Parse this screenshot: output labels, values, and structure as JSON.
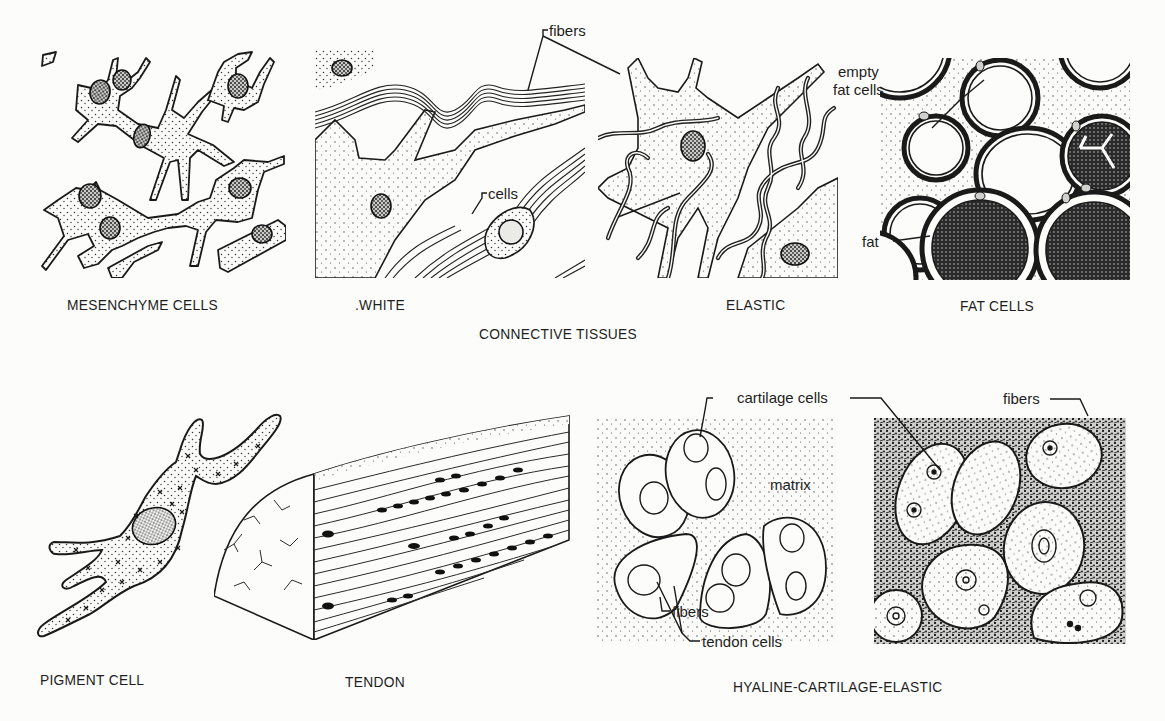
{
  "page": {
    "section_title": "CONNECTIVE TISSUES",
    "ink_color": "#1a1a1a",
    "paper_color": "#fcfcfb"
  },
  "top_row": {
    "panels": [
      {
        "id": "mesenchyme",
        "caption": "MESENCHYME CELLS"
      },
      {
        "id": "white",
        "caption": ".WHITE"
      },
      {
        "id": "elastic",
        "caption": "ELASTIC"
      },
      {
        "id": "fat",
        "caption": "FAT CELLS"
      }
    ],
    "callouts": {
      "fibers": "fibers",
      "cells": "cells",
      "empty_fat_cells_line1": "empty",
      "empty_fat_cells_line2": "fat cells",
      "fat": "fat"
    }
  },
  "bottom_row": {
    "panels": [
      {
        "id": "pigment",
        "caption": "PIGMENT CELL"
      },
      {
        "id": "tendon",
        "caption": "TENDON"
      },
      {
        "id": "cartilage",
        "caption": "HYALINE-CARTILAGE-ELASTIC"
      }
    ],
    "callouts": {
      "tendon_fibers": "fibers",
      "tendon_cells": "tendon cells",
      "cartilage_cells": "cartilage cells",
      "matrix": "matrix",
      "cartilage_fibers": "fibers"
    }
  }
}
